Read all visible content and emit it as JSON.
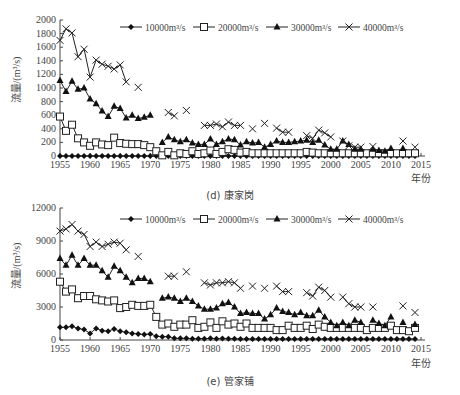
{
  "chart_data": [
    {
      "id": "d",
      "type": "line",
      "title": "(d) 康家岗",
      "xlabel": "年份",
      "ylabel": "流量/(m³/s)",
      "ylim": [
        0,
        2000
      ],
      "yticks": [
        0,
        200,
        400,
        600,
        800,
        1000,
        1200,
        1400,
        1600,
        1800,
        2000
      ],
      "xlim": [
        1955,
        2015
      ],
      "xticks": [
        1955,
        1960,
        1965,
        1970,
        1975,
        1980,
        1985,
        1990,
        1995,
        2000,
        2005,
        2010,
        2015
      ],
      "grid": false,
      "legend_position": "top-right",
      "series": [
        {
          "name": "10000m³/s",
          "marker": "diamond",
          "x": [
            1955,
            1956,
            1957,
            1958,
            1959,
            1960,
            1961,
            1962,
            1963,
            1964,
            1965,
            1966,
            1967,
            1968,
            1969,
            1970,
            1971,
            1972,
            1973,
            1974,
            1975,
            1976,
            1977,
            1978,
            1979,
            1980,
            1981,
            1982,
            1983,
            1984,
            1985,
            1986,
            1987,
            1988,
            1989,
            1990,
            1991,
            1992,
            1993,
            1994,
            1995,
            1996,
            1997,
            1998,
            1999,
            2000,
            2001,
            2002,
            2003,
            2004,
            2005,
            2006,
            2007,
            2008,
            2009,
            2010,
            2011,
            2012,
            2013,
            2014
          ],
          "values": [
            0,
            0,
            0,
            0,
            0,
            0,
            0,
            0,
            0,
            0,
            0,
            0,
            0,
            0,
            0,
            0,
            0,
            0,
            0,
            0,
            0,
            0,
            0,
            0,
            0,
            0,
            0,
            0,
            0,
            0,
            0,
            0,
            0,
            0,
            0,
            0,
            0,
            0,
            0,
            0,
            0,
            0,
            0,
            0,
            0,
            0,
            0,
            0,
            0,
            0,
            0,
            0,
            0,
            0,
            0,
            0,
            0,
            0,
            0,
            0
          ]
        },
        {
          "name": "20000m³/s",
          "marker": "square-open",
          "x": [
            1955,
            1956,
            1957,
            1958,
            1959,
            1960,
            1961,
            1962,
            1963,
            1964,
            1965,
            1966,
            1967,
            1968,
            1969,
            1970,
            1971,
            1972,
            1973,
            1974,
            1975,
            1976,
            1977,
            1978,
            1979,
            1980,
            1981,
            1982,
            1983,
            1984,
            1985,
            1986,
            1987,
            1988,
            1989,
            1990,
            1991,
            1992,
            1993,
            1994,
            1995,
            1996,
            1997,
            1998,
            1999,
            2000,
            2001,
            2002,
            2003,
            2004,
            2005,
            2006,
            2007,
            2008,
            2009,
            2010,
            2011,
            2012,
            2013,
            2014
          ],
          "values": [
            580,
            370,
            460,
            260,
            200,
            150,
            200,
            170,
            160,
            270,
            190,
            180,
            175,
            175,
            160,
            130,
            70,
            10,
            60,
            10,
            40,
            30,
            70,
            30,
            40,
            80,
            30,
            60,
            100,
            90,
            50,
            60,
            40,
            40,
            40,
            40,
            40,
            40,
            40,
            40,
            40,
            60,
            50,
            40,
            40,
            40,
            40,
            40,
            40,
            40,
            40,
            40,
            40,
            40,
            40,
            40,
            40,
            40,
            40,
            40
          ]
        },
        {
          "name": "30000m³/s",
          "marker": "triangle",
          "x": [
            1955,
            1956,
            1957,
            1958,
            1959,
            1960,
            1961,
            1962,
            1963,
            1964,
            1965,
            1966,
            1967,
            1968,
            1969,
            1970,
            null,
            1972,
            1973,
            1974,
            1975,
            1976,
            1977,
            1978,
            1979,
            1980,
            1981,
            1982,
            1983,
            1984,
            1985,
            1986,
            1987,
            1988,
            1989,
            1990,
            1991,
            1992,
            1993,
            1994,
            1995,
            1996,
            1997,
            1998,
            1999,
            2000,
            2001,
            2002,
            2003,
            2004,
            2005,
            2006,
            2007,
            2008,
            2009,
            2010,
            2011,
            2012,
            2013,
            2014
          ],
          "values": [
            1110,
            950,
            1100,
            980,
            1000,
            840,
            770,
            660,
            580,
            730,
            700,
            560,
            600,
            550,
            570,
            600,
            null,
            200,
            280,
            240,
            210,
            240,
            190,
            170,
            170,
            250,
            170,
            210,
            250,
            240,
            160,
            210,
            190,
            200,
            130,
            170,
            220,
            200,
            200,
            210,
            220,
            230,
            200,
            230,
            160,
            100,
            100,
            220,
            170,
            100,
            100,
            null,
            100,
            80,
            70,
            110,
            null,
            110,
            null,
            null
          ]
        },
        {
          "name": "40000m³/s",
          "marker": "x",
          "x": [
            1955,
            1956,
            1957,
            1958,
            1959,
            1960,
            1961,
            1962,
            1963,
            1964,
            1965,
            1966,
            1968,
            1973,
            1974,
            1976,
            1979,
            1980,
            1981,
            1982,
            1983,
            1984,
            1985,
            1987,
            1989,
            1991,
            1992,
            1993,
            1996,
            1997,
            1998,
            1999,
            2000,
            2002,
            2003,
            2004,
            2005,
            2007,
            2012,
            2014
          ],
          "values": [
            1700,
            1870,
            1810,
            1460,
            1570,
            1160,
            1410,
            1350,
            1320,
            1280,
            1340,
            1090,
            1010,
            640,
            590,
            670,
            450,
            450,
            470,
            430,
            500,
            450,
            450,
            400,
            480,
            410,
            350,
            350,
            300,
            260,
            380,
            340,
            280,
            220,
            150,
            130,
            130,
            140,
            220,
            130
          ]
        }
      ]
    },
    {
      "id": "e",
      "type": "line",
      "title": "(e) 管家铺",
      "xlabel": "年份",
      "ylabel": "流量/(m³/s)",
      "ylim": [
        0,
        12000
      ],
      "yticks": [
        0,
        3000,
        6000,
        9000,
        12000
      ],
      "xlim": [
        1955,
        2015
      ],
      "xticks": [
        1955,
        1960,
        1965,
        1970,
        1975,
        1980,
        1985,
        1990,
        1995,
        2000,
        2005,
        2010,
        2015
      ],
      "grid": false,
      "legend_position": "top-right",
      "series": [
        {
          "name": "10000m³/s",
          "marker": "diamond",
          "x": [
            1955,
            1956,
            1957,
            1958,
            1959,
            1960,
            1961,
            1962,
            1963,
            1964,
            1965,
            1966,
            1967,
            1968,
            1969,
            1970,
            1971,
            1972,
            1973,
            1974,
            1975,
            1976,
            1977,
            1978,
            1979,
            1980,
            1981,
            1982,
            1983,
            1984,
            1985,
            1986,
            1987,
            1988,
            1989,
            1990,
            1991,
            1992,
            1993,
            1994,
            1995,
            1996,
            1997,
            1998,
            1999,
            2000,
            2001,
            2002,
            2003,
            2004,
            2005,
            2006,
            2007,
            2008,
            2009,
            2010,
            2011,
            2012,
            2013,
            2014
          ],
          "values": [
            1150,
            1150,
            1250,
            1050,
            950,
            600,
            1050,
            850,
            800,
            1000,
            800,
            700,
            600,
            550,
            500,
            550,
            350,
            300,
            300,
            150,
            150,
            150,
            120,
            120,
            120,
            150,
            120,
            130,
            120,
            110,
            100,
            100,
            100,
            100,
            100,
            100,
            100,
            100,
            100,
            100,
            100,
            100,
            100,
            100,
            100,
            100,
            100,
            100,
            100,
            100,
            100,
            100,
            100,
            100,
            100,
            100,
            100,
            100,
            100,
            100
          ]
        },
        {
          "name": "20000m³/s",
          "marker": "square-open",
          "x": [
            1955,
            1956,
            1957,
            1958,
            1959,
            1960,
            1961,
            1962,
            1963,
            1964,
            1965,
            1966,
            1967,
            1968,
            1969,
            1970,
            1971,
            1972,
            1973,
            1974,
            1975,
            1976,
            1977,
            1978,
            1979,
            1980,
            1981,
            1982,
            1983,
            1984,
            1985,
            1986,
            1987,
            1988,
            1989,
            1990,
            1991,
            1992,
            1993,
            1994,
            1995,
            1996,
            1997,
            1998,
            1999,
            2000,
            2001,
            2002,
            2003,
            2004,
            2005,
            2006,
            2007,
            2008,
            2009,
            2010,
            2011,
            2012,
            2013,
            2014
          ],
          "values": [
            5300,
            4400,
            4600,
            3800,
            4000,
            4000,
            3700,
            3600,
            3500,
            3600,
            2900,
            3000,
            3200,
            3100,
            3100,
            3200,
            2100,
            1400,
            1500,
            1200,
            1400,
            1400,
            1800,
            1100,
            1200,
            1600,
            1100,
            1700,
            1400,
            1500,
            1200,
            1500,
            1100,
            1100,
            1100,
            1100,
            900,
            900,
            1300,
            1100,
            1100,
            1300,
            1000,
            1400,
            1200,
            1100,
            1100,
            1100,
            1100,
            1100,
            1100,
            900,
            1100,
            1100,
            1100,
            1300,
            900,
            900,
            800,
            1100
          ]
        },
        {
          "name": "30000m³/s",
          "marker": "triangle",
          "x": [
            1955,
            1956,
            1957,
            1958,
            1959,
            1960,
            1961,
            1962,
            1963,
            1964,
            1965,
            1966,
            1967,
            1968,
            1969,
            1970,
            1972,
            1973,
            1974,
            1975,
            1976,
            1977,
            1978,
            1979,
            1980,
            1981,
            1982,
            1983,
            1984,
            1985,
            1986,
            1987,
            1988,
            1989,
            1990,
            1991,
            1992,
            1993,
            1994,
            1995,
            1996,
            1997,
            1998,
            1999,
            2000,
            2001,
            2002,
            2003,
            2004,
            2005,
            2007,
            2008,
            2009,
            2010,
            2012,
            2014
          ],
          "values": [
            7400,
            6800,
            7700,
            6800,
            7400,
            6800,
            6800,
            6300,
            5700,
            6700,
            6300,
            5700,
            5200,
            5600,
            5600,
            5300,
            3800,
            3900,
            3800,
            3500,
            3800,
            3500,
            3100,
            2800,
            2800,
            2900,
            3300,
            3400,
            3000,
            2400,
            2500,
            2400,
            2400,
            1900,
            2300,
            2900,
            2600,
            2500,
            2300,
            2500,
            2200,
            2200,
            2700,
            2100,
            1600,
            1300,
            1600,
            1300,
            1800,
            1600,
            1800,
            1500,
            1300,
            2100,
            1600,
            1400
          ]
        },
        {
          "name": "40000m³/s",
          "marker": "x",
          "x": [
            1955,
            1956,
            1957,
            1958,
            1959,
            1960,
            1961,
            1962,
            1963,
            1964,
            1965,
            1966,
            1968,
            1973,
            1974,
            1976,
            1979,
            1980,
            1981,
            1982,
            1983,
            1984,
            1985,
            1987,
            1989,
            1991,
            1992,
            1993,
            1996,
            1997,
            1998,
            1999,
            2000,
            2002,
            2003,
            2004,
            2005,
            2007,
            2012,
            2014
          ],
          "values": [
            9900,
            10100,
            10500,
            9900,
            9600,
            8500,
            8900,
            8500,
            8700,
            8900,
            8800,
            8200,
            7600,
            5800,
            5800,
            6200,
            5200,
            5000,
            5200,
            5200,
            5300,
            5200,
            4700,
            4900,
            4700,
            4900,
            4400,
            4400,
            4300,
            4000,
            4800,
            4500,
            3900,
            3900,
            3300,
            3000,
            3000,
            3000,
            3100,
            2500
          ]
        }
      ]
    }
  ],
  "legend": {
    "items": [
      {
        "label": "10000m³/s",
        "marker": "diamond"
      },
      {
        "label": "20000m³/s",
        "marker": "square-open"
      },
      {
        "label": "30000m³/s",
        "marker": "triangle"
      },
      {
        "label": "40000m³/s",
        "marker": "x"
      }
    ]
  },
  "captions": {
    "d": "(d) 康家岗",
    "e": "(e) 管家铺"
  },
  "axis_labels": {
    "x": "年份",
    "y": "流量/(m³/s)"
  }
}
